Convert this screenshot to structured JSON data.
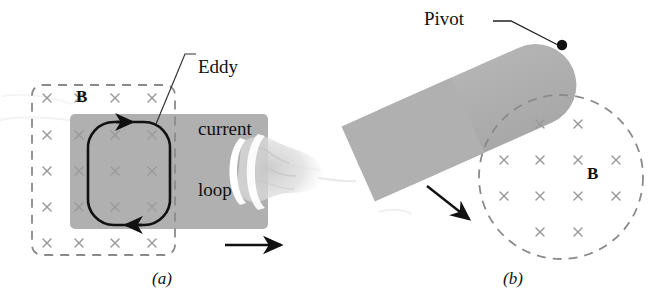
{
  "figure": {
    "background_color": "#ffffff",
    "plate_color": "#b0b0b0",
    "dashed_color": "#8a8a8a",
    "x_mark_color": "#9a9a9a",
    "ink_color": "#111111"
  },
  "panel_a": {
    "caption": "(a)",
    "field_label": "B",
    "annotation": {
      "line1": "Eddy",
      "line2": "current",
      "line3": "loop"
    },
    "field_region": {
      "shape": "dashed-rounded-rectangle",
      "x": 32,
      "y": 85,
      "width": 143,
      "height": 170,
      "x_mark_columns": 4,
      "x_mark_rows": 5,
      "x_mark_symbol": "×"
    },
    "plate": {
      "shape": "rounded-rectangle",
      "x": 70,
      "y": 114,
      "width": 198,
      "height": 115
    },
    "eddy_loop": {
      "shape": "rounded-rectangle-loop",
      "x": 88,
      "y": 122,
      "width": 82,
      "height": 103,
      "direction": "clockwise",
      "arrowhead_top": "right",
      "arrowhead_bottom": "left"
    },
    "motion_arrow": {
      "label": "velocity",
      "from_x": 225,
      "from_y": 245,
      "to_x": 285,
      "to_y": 245,
      "direction": "right"
    },
    "hand": {
      "present": true,
      "description": "hand gripping plate edge"
    }
  },
  "panel_b": {
    "caption": "(b)",
    "field_label": "B",
    "pivot_label": "Pivot",
    "bar": {
      "shape": "rounded-bar",
      "rotation_deg": -24,
      "length": 235,
      "thickness": 82
    },
    "pivot_point": {
      "cx": 562,
      "cy": 45,
      "r": 5
    },
    "field_region": {
      "shape": "dashed-circle",
      "cx": 561,
      "cy": 177,
      "r": 82,
      "x_mark_symbol": "×",
      "x_mark_rows": [
        2,
        4,
        4,
        2
      ]
    },
    "motion_arrow": {
      "label": "swing direction",
      "from_x": 427,
      "from_y": 186,
      "to_x": 472,
      "to_y": 222,
      "direction": "down-right"
    }
  }
}
